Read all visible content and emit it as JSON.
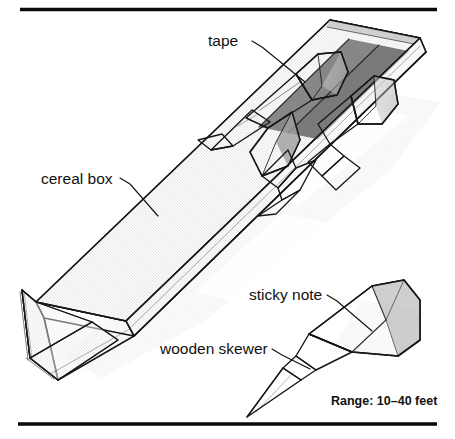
{
  "figure": {
    "title_text": null,
    "background_color": "#ffffff",
    "rules": {
      "top": {
        "x1": 20,
        "y1": 9.5,
        "x2": 437,
        "y2": 9.5
      },
      "bottom": {
        "x1": 18,
        "y1": 424,
        "x2": 437,
        "y2": 424
      },
      "color": "#0a0a0a"
    },
    "palette": {
      "ink": "#16161a",
      "box_top_face": "#a9a9a9",
      "box_inner_face": "#8d8d8d",
      "box_dark_band": "#6e6e6e",
      "box_edge_strip": "#c9c9c9",
      "paper_light": "#efefef",
      "paper_mid": "#d4d4d4",
      "shadow": "#dcdcdc",
      "text": "#111111"
    }
  },
  "labels": [
    {
      "id": "tape",
      "text": "tape",
      "text_x": 208,
      "text_y": 46,
      "anchor": "start",
      "leader": "M252,41 L262,47 L305,82"
    },
    {
      "id": "cereal-box",
      "text": "cereal box",
      "text_x": 41,
      "text_y": 184,
      "anchor": "start",
      "leader": "M120,178 L130,184 L158,216"
    },
    {
      "id": "sticky-note",
      "text": "sticky note",
      "text_x": 249,
      "text_y": 300,
      "anchor": "start",
      "leader": "M327,295 L337,301 L372,331"
    },
    {
      "id": "wooden-skewer",
      "text": "wooden skewer",
      "text_x": 160,
      "text_y": 354,
      "anchor": "start",
      "leader": "M272,349 L282,355 L310,369"
    }
  ],
  "annotations": [
    {
      "id": "range-note",
      "text": "Range: 10–40 feet",
      "x": 331,
      "y": 405,
      "bold": true
    }
  ],
  "objects": [
    {
      "id": "cereal-box-channel",
      "name": "cereal box",
      "description": "V-shaped triangular channel made from a cereal box, angled from lower-left to upper-right"
    },
    {
      "id": "dart-upper",
      "name": "tape-wrapped dart",
      "description": "skewer dart with cone sticky-note fin taped near the top of the channel"
    },
    {
      "id": "dart-middle",
      "name": "dart in channel",
      "description": "second skewer dart resting in the channel"
    },
    {
      "id": "dart-lower",
      "name": "dart in channel",
      "description": "third skewer dart resting in the channel"
    },
    {
      "id": "skewer-detail",
      "name": "wooden skewer with sticky note",
      "description": "detail view of a single skewer with a rolled sticky-note cone at the blunt end"
    }
  ]
}
